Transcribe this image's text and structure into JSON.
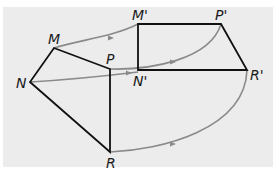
{
  "diagram": {
    "type": "geometric-transformation",
    "colors": {
      "background": "#ececec",
      "edges": "#111111",
      "arrows": "#8a8a8a"
    },
    "original": {
      "vertices": [
        {
          "name": "M",
          "label": "M",
          "x": 54,
          "y": 48
        },
        {
          "name": "P",
          "label": "P",
          "x": 110,
          "y": 69
        },
        {
          "name": "R",
          "label": "R",
          "x": 110,
          "y": 152
        },
        {
          "name": "N",
          "label": "N",
          "x": 30,
          "y": 82
        }
      ]
    },
    "image": {
      "vertices": [
        {
          "name": "M-prime",
          "label": "M'",
          "x": 138,
          "y": 24
        },
        {
          "name": "P-prime",
          "label": "P'",
          "x": 221,
          "y": 24
        },
        {
          "name": "R-prime",
          "label": "R'",
          "x": 247,
          "y": 70
        },
        {
          "name": "N-prime",
          "label": "N'",
          "x": 138,
          "y": 70
        }
      ]
    },
    "mappings": [
      {
        "from": "M",
        "to": "M'"
      },
      {
        "from": "N",
        "to": "N'"
      },
      {
        "from": "P",
        "to": "P'"
      },
      {
        "from": "R",
        "to": "R'"
      }
    ]
  }
}
